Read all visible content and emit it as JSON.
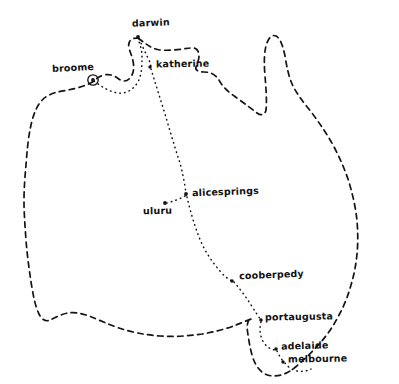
{
  "map": {
    "title": "australia hand-drawn route map",
    "subject": "Australia",
    "style": "hand-drawn dashed coastline with dotted travel route",
    "background_color": "#ffffff",
    "ink_color": "#141414",
    "coastline_style": "dashed",
    "route_style": "dotted"
  },
  "cities": [
    {
      "id": "darwin",
      "label": "darwin",
      "label_x": 132,
      "label_y": 18,
      "marker_x": 138,
      "marker_y": 37,
      "marker_type": "dot",
      "tilt": "tilt-b"
    },
    {
      "id": "broome",
      "label": "broome",
      "label_x": 52,
      "label_y": 63,
      "marker_x": 93,
      "marker_y": 80,
      "marker_type": "circled-dot",
      "tilt": "tilt-a"
    },
    {
      "id": "katherine",
      "label": "katherine",
      "label_x": 156,
      "label_y": 59,
      "marker_x": 150,
      "marker_y": 67,
      "marker_type": "dot",
      "tilt": "tilt-c"
    },
    {
      "id": "alicesprings",
      "label": "alicesprings",
      "label_x": 192,
      "label_y": 187,
      "marker_x": 186,
      "marker_y": 194,
      "marker_type": "dot",
      "tilt": "tilt-b"
    },
    {
      "id": "uluru",
      "label": "uluru",
      "label_x": 143,
      "label_y": 212,
      "marker_x": 165,
      "marker_y": 203,
      "marker_type": "dot",
      "tilt": "tilt-c"
    },
    {
      "id": "cooberpedy",
      "label": "cooberpedy",
      "label_x": 239,
      "label_y": 272,
      "marker_x": 232,
      "marker_y": 281,
      "marker_type": "dot",
      "tilt": "tilt-b"
    },
    {
      "id": "portaugusta",
      "label": "portaugusta",
      "label_x": 265,
      "label_y": 313,
      "marker_x": 261,
      "marker_y": 320,
      "marker_type": "dot",
      "tilt": "tilt-c"
    },
    {
      "id": "adelaide",
      "label": "adelaide",
      "label_x": 281,
      "label_y": 342,
      "marker_x": 276,
      "marker_y": 349,
      "marker_type": "dot",
      "tilt": "tilt-b"
    },
    {
      "id": "melbourne",
      "label": "melbourne",
      "label_x": 288,
      "label_y": 355,
      "marker_x": 283,
      "marker_y": 362,
      "marker_type": "dot",
      "tilt": "tilt-c"
    }
  ],
  "route": {
    "name": "travel-route",
    "waypoints": [
      "broome",
      "darwin",
      "katherine",
      "alicesprings",
      "uluru",
      "cooberpedy",
      "portaugusta",
      "adelaide",
      "melbourne"
    ]
  }
}
